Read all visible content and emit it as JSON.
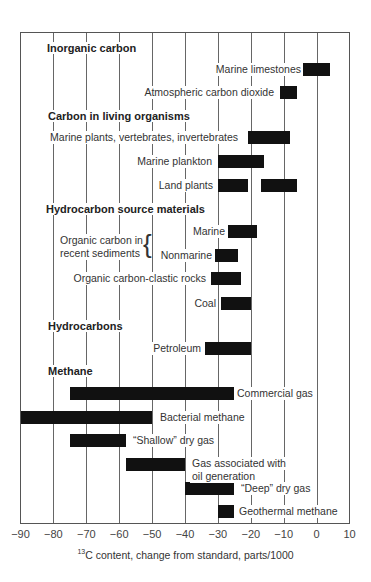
{
  "chart_data": {
    "type": "bar",
    "subtype": "floating-range",
    "title": "",
    "xlabel_sup": "13",
    "xlabel": "C content, change from standard, parts/1000",
    "xlim": [
      -90,
      10
    ],
    "xticks": [
      -90,
      -80,
      -70,
      -60,
      -50,
      -40,
      -30,
      -20,
      -10,
      0,
      10
    ],
    "grid": true,
    "groups": [
      {
        "name": "Inorganic carbon",
        "y": 49,
        "items": [
          {
            "label": "Marine limestones",
            "ranges": [
              [
                -4,
                4
              ]
            ],
            "y": 69,
            "label_side": "left"
          },
          {
            "label": "Atmospheric carbon dioxide",
            "ranges": [
              [
                -11,
                -6
              ]
            ],
            "y": 92,
            "label_side": "left"
          }
        ]
      },
      {
        "name": "Carbon in living organisms",
        "y": 117,
        "items": [
          {
            "label": "Marine plants, vertebrates, invertebrates",
            "ranges": [
              [
                -21,
                -8
              ]
            ],
            "y": 137,
            "label_side": "left"
          },
          {
            "label": "Marine plankton",
            "ranges": [
              [
                -30,
                -16
              ]
            ],
            "y": 161,
            "label_side": "left"
          },
          {
            "label": "Land plants",
            "ranges": [
              [
                -30,
                -21
              ],
              [
                -17,
                -6
              ]
            ],
            "y": 185,
            "label_side": "left"
          }
        ]
      },
      {
        "name": "Hydrocarbon source materials",
        "y": 210,
        "items": [
          {
            "label": "Marine",
            "ranges": [
              [
                -27,
                -18
              ]
            ],
            "y": 231,
            "label_side": "left"
          },
          {
            "label": "Nonmarine",
            "ranges": [
              [
                -31,
                -24
              ]
            ],
            "y": 255,
            "label_side": "left"
          },
          {
            "label": "Organic carbon-clastic rocks",
            "ranges": [
              [
                -32,
                -23
              ]
            ],
            "y": 278,
            "label_side": "left"
          },
          {
            "label": "Coal",
            "ranges": [
              [
                -29,
                -20
              ]
            ],
            "y": 303,
            "label_side": "left"
          }
        ]
      },
      {
        "name": "Hydrocarbons",
        "y": 327,
        "items": [
          {
            "label": "Petroleum",
            "ranges": [
              [
                -34,
                -20
              ]
            ],
            "y": 348,
            "label_side": "left"
          }
        ]
      },
      {
        "name": "Methane",
        "y": 372,
        "items": [
          {
            "label": "Commercial gas",
            "ranges": [
              [
                -75,
                -25
              ]
            ],
            "y": 393,
            "label_side": "right"
          },
          {
            "label": "Bacterial methane",
            "ranges": [
              [
                -90,
                -50
              ]
            ],
            "y": 417,
            "label_side": "right"
          },
          {
            "label": "“Shallow” dry gas",
            "ranges": [
              [
                -75,
                -58
              ]
            ],
            "y": 440,
            "label_side": "right"
          },
          {
            "label": "Gas associated with oil generation",
            "ranges": [
              [
                -58,
                -40
              ]
            ],
            "y": 464,
            "label_side": "right"
          },
          {
            "label": "“Deep” dry gas",
            "ranges": [
              [
                -40,
                -25
              ]
            ],
            "y": 488,
            "label_side": "right"
          },
          {
            "label": "Geothermal methane",
            "ranges": [
              [
                -30,
                -25
              ]
            ],
            "y": 511,
            "label_side": "right"
          }
        ]
      }
    ],
    "brace_label": "Organic carbon in recent sediments"
  },
  "labels": {
    "g0": "Inorganic carbon",
    "g1": "Carbon in living organisms",
    "g2": "Hydrocarbon source materials",
    "g3": "Hydrocarbons",
    "g4": "Methane",
    "marine_limestones": "Marine limestones",
    "atm_co2": "Atmospheric carbon dioxide",
    "marine_plants": "Marine plants, vertebrates, invertebrates",
    "marine_plankton": "Marine plankton",
    "land_plants": "Land plants",
    "brace_1": "Organic carbon in",
    "brace_2": "recent sediments",
    "marine": "Marine",
    "nonmarine": "Nonmarine",
    "clastic": "Organic carbon-clastic rocks",
    "coal": "Coal",
    "petroleum": "Petroleum",
    "commercial": "Commercial gas",
    "bacterial": "Bacterial methane",
    "shallow": "“Shallow” dry gas",
    "assoc_1": "Gas associated with",
    "assoc_2": "oil generation",
    "deep": "“Deep” dry gas",
    "geothermal": "Geothermal methane",
    "xlabel_sup": "13",
    "xlabel": "C content, change from standard, parts/1000",
    "ticks": [
      "−90",
      "−80",
      "−70",
      "−60",
      "−50",
      "−40",
      "−30",
      "−20",
      "−10",
      "0",
      "10"
    ]
  }
}
